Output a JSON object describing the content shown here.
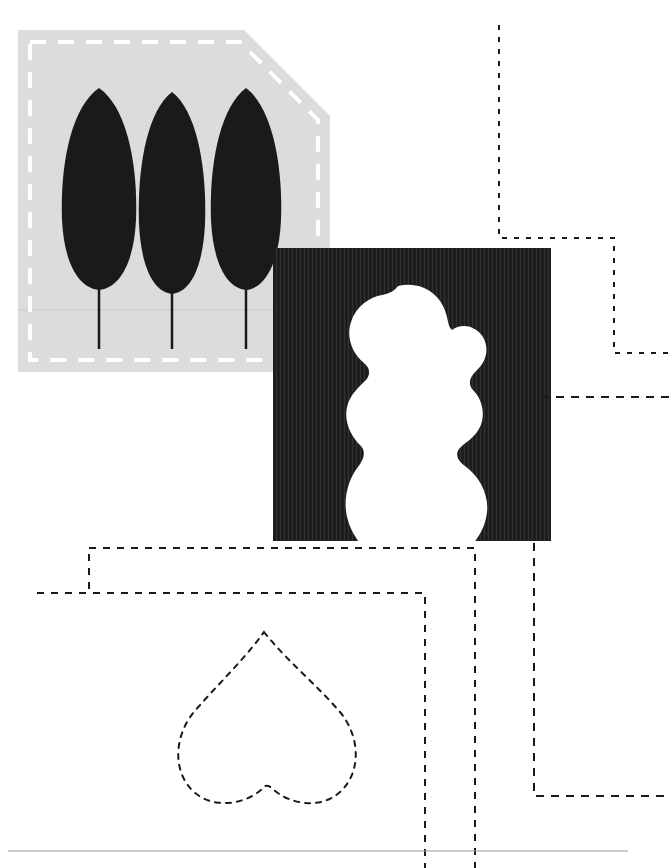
{
  "canvas": {
    "width": 669,
    "height": 868,
    "background_color": "#ffffff",
    "title": "Abstract poster composition with trees, blob and dotted paths"
  },
  "palette": {
    "ink": "#1a1a1a",
    "panel_dark": "#212121",
    "panel_light": "#dcdcdc",
    "paper": "#ffffff",
    "rule_gray": "#9a9a9a",
    "dash_white": "#ffffff"
  },
  "tree_panel": {
    "label": "Tree panel",
    "fill_color": "#dcdcdc",
    "x": 18,
    "y": 30,
    "width": 312,
    "height": 342,
    "notch_corner": "top-right",
    "notch_size": 86,
    "dashed_border": {
      "color": "#ffffff",
      "width": 4,
      "dash": "16 12",
      "inset": 11
    },
    "trees": [
      {
        "name": "tree-left",
        "cx": 99,
        "crown_top": 88,
        "crown_bottom": 288,
        "crown_rx": 39,
        "trunk_bottom": 349
      },
      {
        "name": "tree-center",
        "cx": 172,
        "crown_top": 92,
        "crown_bottom": 292,
        "crown_rx": 34,
        "trunk_bottom": 349
      },
      {
        "name": "tree-right",
        "cx": 246,
        "crown_top": 88,
        "crown_bottom": 288,
        "crown_rx": 36,
        "trunk_bottom": 349
      }
    ],
    "tree_fill": "#1a1a1a",
    "trunk_width": 2.5
  },
  "blob_panel": {
    "label": "Blob panel",
    "fill_color": "#212121",
    "x": 273,
    "y": 248,
    "width": 278,
    "height": 293,
    "texture": "vertical-corduroy",
    "texture_stripe_color": "#2e2e2e",
    "texture_period": 4,
    "blob": {
      "name": "organic-blob",
      "fill_color": "#ffffff",
      "bbox": {
        "x": 343,
        "y": 283,
        "width": 140,
        "height": 212
      }
    }
  },
  "heart_outline": {
    "label": "Dotted heart outline",
    "stroke_color": "#1a1a1a",
    "stroke_width": 2,
    "dash": "5 6",
    "bbox": {
      "x": 168,
      "y": 630,
      "width": 192,
      "height": 180
    }
  },
  "dotted_paths": [
    {
      "name": "path-top-right-step",
      "dash": "5 7",
      "stroke_color": "#1a1a1a",
      "stroke_width": 2
    },
    {
      "name": "path-mid-right-tail",
      "dash": "8 7",
      "stroke_color": "#1a1a1a",
      "stroke_width": 2
    },
    {
      "name": "path-lower-right-hook",
      "dash": "8 7",
      "stroke_color": "#1a1a1a",
      "stroke_width": 2
    },
    {
      "name": "path-bottom-left-step",
      "dash": "7 7",
      "stroke_color": "#1a1a1a",
      "stroke_width": 2
    },
    {
      "name": "path-bottom-left-lower",
      "dash": "7 7",
      "stroke_color": "#1a1a1a",
      "stroke_width": 2
    }
  ],
  "bottom_rule": {
    "label": "Bottom divider rule",
    "y": 851,
    "x1": 8,
    "x2": 628,
    "color": "#9a9a9a",
    "thickness": 1
  },
  "caption": "Composition of a dashed tree panel, a textured panel with a white organic blob, a dotted heart outline and orthogonal dotted connector paths."
}
